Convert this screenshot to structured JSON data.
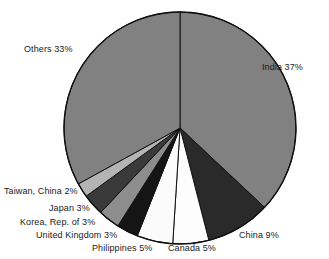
{
  "chart_data": {
    "type": "pie",
    "title": "",
    "subtitle": "",
    "xlabel": "",
    "ylabel": "",
    "legend_position": "none",
    "grid": false,
    "units": "percent",
    "start_angle_deg": 0,
    "direction": "clockwise",
    "total": 100,
    "categories": [
      "India",
      "China",
      "Canada",
      "Philippines",
      "United Kingdom",
      "Korea, Rep. of",
      "Japan",
      "Taiwan, China",
      "Others"
    ],
    "values": [
      37,
      9,
      5,
      5,
      3,
      3,
      3,
      2,
      33
    ],
    "slice_colors": [
      "#818181",
      "#2a2a2a",
      "#fdfdfd",
      "#fbfbfb",
      "#151515",
      "#8d8d8d",
      "#3a3a3a",
      "#b4b4b4",
      "#818181"
    ],
    "slices": [
      {
        "label": "India 37%",
        "name": "India",
        "value": 37,
        "color": "#818181"
      },
      {
        "label": "China 9%",
        "name": "China",
        "value": 9,
        "color": "#2a2a2a"
      },
      {
        "label": "Canada 5%",
        "name": "Canada",
        "value": 5,
        "color": "#fdfdfd"
      },
      {
        "label": "Philippines 5%",
        "name": "Philippines",
        "value": 5,
        "color": "#fbfbfb"
      },
      {
        "label": "United Kingdom  3%",
        "name": "United Kingdom",
        "value": 3,
        "color": "#151515"
      },
      {
        "label": "Korea, Rep. of 3%",
        "name": "Korea, Rep. of",
        "value": 3,
        "color": "#8d8d8d"
      },
      {
        "label": "Japan 3%",
        "name": "Japan",
        "value": 3,
        "color": "#3a3a3a"
      },
      {
        "label": "Taiwan, China 2%",
        "name": "Taiwan, China",
        "value": 2,
        "color": "#b4b4b4"
      },
      {
        "label": "Others 33%",
        "name": "Others",
        "value": 33,
        "color": "#818181"
      }
    ]
  },
  "geometry": {
    "center_x": 180,
    "center_y": 128,
    "radius": 116,
    "outline_color": "#101010"
  },
  "labels": {
    "india": {
      "text": "India 37%",
      "x": 262,
      "y": 62
    },
    "china": {
      "text": "China 9%",
      "x": 239,
      "y": 230
    },
    "canada": {
      "text": "Canada 5%",
      "x": 168,
      "y": 243
    },
    "philippines": {
      "text": "Philippines 5%",
      "x": 92,
      "y": 243
    },
    "united_kingdom": {
      "text": "United Kingdom  3%",
      "x": 36,
      "y": 230
    },
    "korea": {
      "text": "Korea, Rep. of 3%",
      "x": 20,
      "y": 217
    },
    "japan": {
      "text": "Japan 3%",
      "x": 49,
      "y": 203
    },
    "taiwan": {
      "text": "Taiwan, China 2%",
      "x": 4,
      "y": 186
    },
    "others": {
      "text": "Others 33%",
      "x": 24,
      "y": 44
    }
  },
  "footnote": {
    "text": ""
  }
}
